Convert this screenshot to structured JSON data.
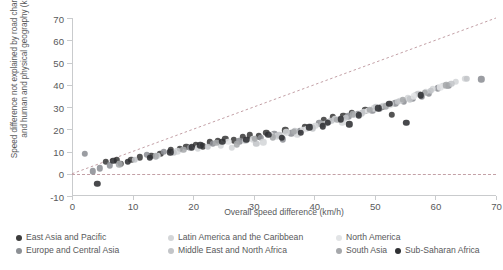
{
  "chart_data": {
    "type": "scatter",
    "title": "",
    "xlabel": "Overall speed difference (km/h)",
    "ylabel": "Speed difference not explained by road characteristics and human and physical geography (km/h)",
    "xlim": [
      0,
      70
    ],
    "ylim": [
      -10,
      70
    ],
    "xticks": [
      0,
      10,
      20,
      30,
      40,
      50,
      60,
      70
    ],
    "yticks": [
      -10,
      0,
      10,
      20,
      30,
      40,
      50,
      60,
      70
    ],
    "grid": false,
    "legend_position": "bottom",
    "annotations": [
      {
        "name": "zero-reference-line",
        "type": "hline",
        "y": 0,
        "style": "dashed"
      },
      {
        "name": "identity-reference-line",
        "type": "line",
        "from": [
          0,
          0
        ],
        "to": [
          70,
          70
        ],
        "style": "dashed"
      }
    ],
    "series": [
      {
        "name": "East Asia and Pacific",
        "color": "#3c3c3c",
        "points": [
          [
            5.6,
            5.3
          ],
          [
            7.4,
            6.1
          ],
          [
            8.1,
            4.6
          ],
          [
            9.8,
            6.2
          ],
          [
            11.2,
            7.4
          ],
          [
            13.1,
            8.0
          ],
          [
            14.6,
            9.1
          ],
          [
            16.3,
            10.5
          ],
          [
            17.8,
            11.2
          ],
          [
            18.9,
            12.0
          ],
          [
            20.4,
            13.1
          ],
          [
            21.6,
            12.4
          ],
          [
            22.8,
            14.2
          ],
          [
            24.1,
            14.9
          ],
          [
            25.3,
            15.6
          ],
          [
            26.7,
            15.1
          ],
          [
            28.2,
            16.4
          ],
          [
            29.4,
            17.2
          ],
          [
            30.8,
            16.8
          ],
          [
            32.1,
            18.4
          ],
          [
            35.2,
            19.6
          ],
          [
            38.4,
            20.8
          ],
          [
            41.6,
            24.2
          ],
          [
            43.1,
            25.4
          ],
          [
            44.8,
            26.1
          ],
          [
            46.2,
            27.3
          ],
          [
            48.4,
            28.6
          ],
          [
            51.2,
            30.2
          ],
          [
            52.8,
            26.4
          ]
        ]
      },
      {
        "name": "Europe and Central Asia",
        "color": "#8d9095",
        "points": [
          [
            2.1,
            8.9
          ],
          [
            3.4,
            1.1
          ],
          [
            4.6,
            2.4
          ],
          [
            6.2,
            3.8
          ],
          [
            12.4,
            8.6
          ],
          [
            15.2,
            9.8
          ],
          [
            19.4,
            11.6
          ],
          [
            23.2,
            13.4
          ],
          [
            27.6,
            14.6
          ],
          [
            31.2,
            16.2
          ],
          [
            33.4,
            17.8
          ],
          [
            34.8,
            15.4
          ],
          [
            36.2,
            18.2
          ],
          [
            37.6,
            19.4
          ],
          [
            39.4,
            21.2
          ],
          [
            40.8,
            22.6
          ],
          [
            42.4,
            23.4
          ],
          [
            45.6,
            25.8
          ],
          [
            47.2,
            26.9
          ],
          [
            49.6,
            28.4
          ],
          [
            50.8,
            29.2
          ],
          [
            53.4,
            31.6
          ],
          [
            54.8,
            32.4
          ],
          [
            56.2,
            33.8
          ],
          [
            57.8,
            34.6
          ],
          [
            58.9,
            36.2
          ],
          [
            60.4,
            38.4
          ],
          [
            62.1,
            39.6
          ],
          [
            67.6,
            42.4
          ]
        ]
      },
      {
        "name": "Latin America and the Caribbean",
        "color": "#d4d6d8",
        "points": [
          [
            14.2,
            8.2
          ],
          [
            17.4,
            10.1
          ],
          [
            20.8,
            11.4
          ],
          [
            24.6,
            12.8
          ],
          [
            26.4,
            11.6
          ],
          [
            29.8,
            15.4
          ],
          [
            31.6,
            14.2
          ],
          [
            33.8,
            16.8
          ],
          [
            35.4,
            18.6
          ],
          [
            37.2,
            17.4
          ],
          [
            38.8,
            20.2
          ],
          [
            40.2,
            21.6
          ],
          [
            41.8,
            22.4
          ],
          [
            43.4,
            24.6
          ],
          [
            44.6,
            23.2
          ],
          [
            46.8,
            26.4
          ],
          [
            48.2,
            27.8
          ],
          [
            49.8,
            29.4
          ],
          [
            51.4,
            30.6
          ],
          [
            52.6,
            31.2
          ],
          [
            54.2,
            32.8
          ],
          [
            55.4,
            34.2
          ],
          [
            56.8,
            35.4
          ],
          [
            58.4,
            36.8
          ],
          [
            59.6,
            38.2
          ],
          [
            61.2,
            39.4
          ],
          [
            63.4,
            41.2
          ],
          [
            64.8,
            42.6
          ]
        ]
      },
      {
        "name": "Middle East and North Africa",
        "color": "#c3c5c8",
        "points": [
          [
            10.4,
            6.4
          ],
          [
            16.8,
            9.4
          ],
          [
            22.4,
            12.2
          ],
          [
            28.6,
            14.8
          ],
          [
            30.4,
            13.4
          ],
          [
            34.2,
            17.2
          ],
          [
            36.8,
            19.2
          ],
          [
            39.8,
            20.4
          ],
          [
            42.8,
            23.8
          ],
          [
            45.2,
            25.2
          ],
          [
            47.8,
            27.2
          ],
          [
            50.2,
            29.8
          ],
          [
            53.8,
            32.2
          ],
          [
            55.8,
            33.4
          ],
          [
            57.2,
            35.8
          ],
          [
            59.2,
            37.4
          ],
          [
            62.6,
            40.4
          ],
          [
            65.2,
            42.8
          ]
        ]
      },
      {
        "name": "North America",
        "color": "#e2e4e6",
        "points": [
          [
            25.8,
            14.4
          ],
          [
            32.8,
            17.4
          ],
          [
            38.2,
            19.8
          ],
          [
            44.2,
            24.8
          ],
          [
            48.8,
            28.2
          ],
          [
            52.2,
            30.8
          ],
          [
            56.4,
            34.8
          ],
          [
            60.8,
            38.8
          ]
        ]
      },
      {
        "name": "South Asia",
        "color": "#a6a8ab",
        "points": [
          [
            7.8,
            4.2
          ],
          [
            13.8,
            7.8
          ],
          [
            18.4,
            10.8
          ],
          [
            23.8,
            13.8
          ],
          [
            27.2,
            13.2
          ],
          [
            30.2,
            15.8
          ],
          [
            33.2,
            16.4
          ],
          [
            36.6,
            18.8
          ],
          [
            41.2,
            22.2
          ],
          [
            43.8,
            24.2
          ],
          [
            46.4,
            26.8
          ],
          [
            49.2,
            28.8
          ],
          [
            51.8,
            30.4
          ],
          [
            54.6,
            33.2
          ],
          [
            58.2,
            36.4
          ],
          [
            61.8,
            39.8
          ]
        ]
      },
      {
        "name": "Sub-Saharan Africa",
        "color": "#2f3033",
        "points": [
          [
            4.2,
            -4.6
          ],
          [
            6.8,
            5.8
          ],
          [
            9.2,
            5.4
          ],
          [
            12.8,
            7.2
          ],
          [
            16.2,
            9.6
          ],
          [
            19.8,
            11.8
          ],
          [
            21.2,
            12.8
          ],
          [
            24.8,
            14.4
          ],
          [
            28.8,
            15.2
          ],
          [
            32.4,
            17.6
          ],
          [
            34.6,
            16.2
          ],
          [
            37.8,
            18.4
          ],
          [
            39.2,
            20.8
          ],
          [
            41.4,
            21.4
          ],
          [
            42.2,
            22.8
          ],
          [
            44.4,
            24.4
          ],
          [
            45.8,
            22.2
          ],
          [
            47.4,
            26.2
          ],
          [
            50.6,
            29.4
          ],
          [
            52.4,
            31.4
          ],
          [
            55.2,
            22.8
          ],
          [
            57.6,
            35.2
          ]
        ]
      }
    ]
  },
  "axes": {
    "y_title": "Speed difference not explained by road characteristics and human and physical geography (km/h)",
    "x_title": "Overall speed difference (km/h)"
  },
  "legend": {
    "items": [
      {
        "label": "East Asia and Pacific",
        "color": "#3c3c3c"
      },
      {
        "label": "Latin America and the Caribbean",
        "color": "#d4d6d8"
      },
      {
        "label": "North America",
        "color": "#e2e4e6"
      },
      {
        "label": "Europe and Central Asia",
        "color": "#8d9095"
      },
      {
        "label": "Middle East and North Africa",
        "color": "#c3c5c8"
      },
      {
        "label": "South Asia",
        "color": "#a6a8ab"
      },
      {
        "label": "Sub-Saharan Africa",
        "color": "#2f3033"
      }
    ]
  }
}
